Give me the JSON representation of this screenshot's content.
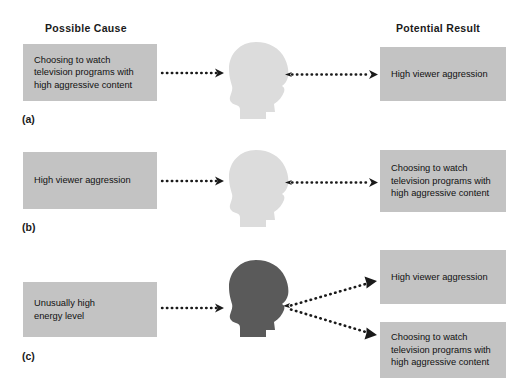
{
  "headers": {
    "cause": "Possible Cause",
    "result": "Potential Result"
  },
  "row_labels": {
    "a": "(a)",
    "b": "(b)",
    "c": "(c)"
  },
  "colors": {
    "box_fill": "#c3c3c3",
    "head_light": "#dcdcdc",
    "head_dark": "#5a5a5a",
    "arrow": "#1a1a1a",
    "text": "#111111",
    "background": "#ffffff"
  },
  "rows": [
    {
      "id": "a",
      "label": "(a)",
      "head_tone": "light",
      "cause": {
        "lines": [
          "Choosing to watch",
          "television programs with",
          "high aggressive content"
        ]
      },
      "results": [
        {
          "lines": [
            "High viewer aggression"
          ]
        }
      ]
    },
    {
      "id": "b",
      "label": "(b)",
      "head_tone": "light",
      "cause": {
        "lines": [
          "High viewer aggression"
        ]
      },
      "results": [
        {
          "lines": [
            "Choosing to watch",
            "television programs with",
            "high aggressive content"
          ]
        }
      ]
    },
    {
      "id": "c",
      "label": "(c)",
      "head_tone": "dark",
      "cause": {
        "lines": [
          "Unusually high",
          "energy level"
        ]
      },
      "results": [
        {
          "lines": [
            "High viewer aggression"
          ]
        },
        {
          "lines": [
            "Choosing to watch",
            "television programs with",
            "high aggressive content"
          ]
        }
      ]
    }
  ],
  "boxes": {
    "a_cause_l1": "Choosing to watch",
    "a_cause_l2": "television programs with",
    "a_cause_l3": "high aggressive content",
    "a_result_l1": "High viewer aggression",
    "b_cause_l1": "High viewer aggression",
    "b_result_l1": "Choosing to watch",
    "b_result_l2": "television programs with",
    "b_result_l3": "high aggressive content",
    "c_cause_l1": "Unusually high",
    "c_cause_l2": "energy level",
    "c_result_top_l1": "High viewer aggression",
    "c_result_bot_l1": "Choosing to watch",
    "c_result_bot_l2": "television programs with",
    "c_result_bot_l3": "high aggressive content"
  },
  "icons": {
    "head": "head-profile-silhouette-icon",
    "arrow": "dotted-arrow-icon"
  }
}
